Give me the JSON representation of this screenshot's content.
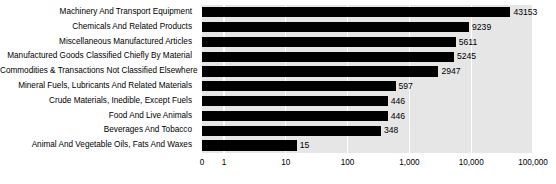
{
  "chart_data": {
    "type": "bar",
    "orientation": "horizontal",
    "title": "",
    "subtitle": "",
    "xlabel": "",
    "ylabel": "",
    "xscale": "log",
    "xlim": [
      0,
      100000
    ],
    "grid": true,
    "legend": null,
    "legend_position": "none",
    "bar_color": "#000000",
    "plot_background": "#e6e6e6",
    "gridline_color": "#ffffff",
    "xticks": [
      "0",
      "1",
      "10",
      "100",
      "1,000",
      "10,000",
      "100,000"
    ],
    "xtick_values": [
      0,
      1,
      10,
      100,
      1000,
      10000,
      100000
    ],
    "categories": [
      "Machinery And Transport Equipment",
      "Chemicals And Related Products",
      "Miscellaneous Manufactured Articles",
      "Manufactured Goods Classified Chiefly By Material",
      "Commodities & Transactions Not Classified Elsewhere",
      "Mineral Fuels, Lubricants And Related Materials",
      "Crude Materials, Inedible, Except Fuels",
      "Food And Live Animals",
      "Beverages And Tobacco",
      "Animal And Vegetable Oils, Fats And Waxes"
    ],
    "values": [
      43153,
      9239,
      5611,
      5245,
      2947,
      597,
      446,
      446,
      348,
      15
    ],
    "value_labels": [
      "43153",
      "9239",
      "5611",
      "5245",
      "2947",
      "597",
      "446",
      "446",
      "348",
      "15"
    ]
  }
}
